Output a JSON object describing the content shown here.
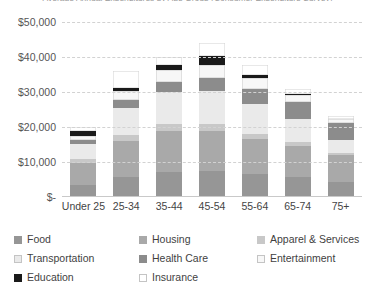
{
  "chart_data": {
    "type": "bar",
    "stacked": true,
    "title": "Average Annual Expenditures by Age Group (Consumer Expenditure Survey)",
    "xlabel": "",
    "ylabel": "",
    "ylim": [
      0,
      50000
    ],
    "grid": true,
    "legend_position": "bottom",
    "categories": [
      "Under 25",
      "25-34",
      "35-44",
      "45-54",
      "55-64",
      "65-74",
      "75+"
    ],
    "ytick_labels": [
      "$50,000",
      "$40,000",
      "$30,000",
      "$20,000",
      "$10,000",
      "$-"
    ],
    "ytick_values": [
      50000,
      40000,
      30000,
      20000,
      10000,
      0
    ],
    "series": [
      {
        "name": "Food",
        "color": "#969696",
        "values": [
          3400,
          5600,
          7200,
          7400,
          6600,
          5600,
          4200
        ]
      },
      {
        "name": "Housing",
        "color": "#a9a9a9",
        "values": [
          6400,
          10400,
          11800,
          11400,
          10000,
          9000,
          7800
        ]
      },
      {
        "name": "Apparel & Services",
        "color": "#c8c8c8",
        "values": [
          1100,
          1800,
          2000,
          2000,
          1500,
          1000,
          700
        ]
      },
      {
        "name": "Transportation",
        "color": "#eaeaea",
        "values": [
          4200,
          7600,
          9000,
          9600,
          8400,
          6600,
          3600
        ]
      },
      {
        "name": "Health Care",
        "color": "#8c8c8c",
        "values": [
          1100,
          2400,
          3000,
          3600,
          4400,
          5000,
          4800
        ]
      },
      {
        "name": "Entertainment",
        "color": "#f7f7f7",
        "values": [
          1300,
          2600,
          3200,
          3600,
          3000,
          2000,
          1100
        ]
      },
      {
        "name": "Education",
        "color": "#1a1a1a",
        "values": [
          1500,
          900,
          1600,
          2600,
          1000,
          300,
          200
        ]
      },
      {
        "name": "Insurance",
        "color": "#ffffff",
        "values": [
          1000,
          4700,
          2200,
          3800,
          2900,
          1500,
          900
        ]
      }
    ],
    "totals": [
      20000,
      36000,
      40000,
      44000,
      37800,
      31000,
      23300
    ]
  },
  "axis": {
    "y_labels": [
      {
        "text": "$50,000",
        "value": 50000
      },
      {
        "text": "$40,000",
        "value": 40000
      },
      {
        "text": "$30,000",
        "value": 30000
      },
      {
        "text": "$20,000",
        "value": 20000
      },
      {
        "text": "$10,000",
        "value": 10000
      },
      {
        "text": "$-",
        "value": 0
      }
    ],
    "x_labels": [
      "Under 25",
      "25-34",
      "35-44",
      "45-54",
      "55-64",
      "65-74",
      "75+"
    ]
  },
  "legend": {
    "items": [
      {
        "label": "Food",
        "color": "#969696"
      },
      {
        "label": "Housing",
        "color": "#a9a9a9"
      },
      {
        "label": "Apparel & Services",
        "color": "#c8c8c8"
      },
      {
        "label": "Transportation",
        "color": "#eaeaea"
      },
      {
        "label": "Health Care",
        "color": "#8c8c8c"
      },
      {
        "label": "Entertainment",
        "color": "#f7f7f7"
      },
      {
        "label": "Education",
        "color": "#1a1a1a"
      },
      {
        "label": "Insurance",
        "color": "#ffffff"
      }
    ]
  },
  "colors": {
    "gridline": "#d2d2d2",
    "axis": "#c9c9c9",
    "text": "#3f3f3f",
    "background": "#ffffff"
  }
}
